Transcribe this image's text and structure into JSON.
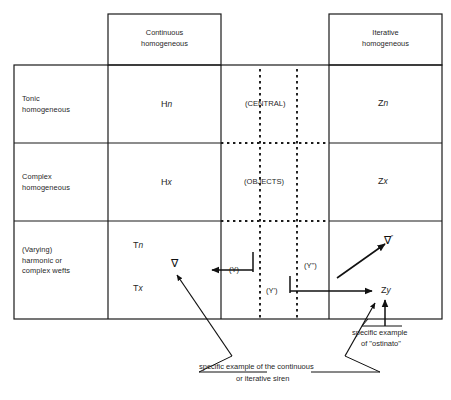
{
  "figure": {
    "kind": "matrix-diagram",
    "column_headers": [
      {
        "id": "continuous",
        "line1": "Continuous",
        "line2": "homogeneous"
      },
      {
        "id": "iterative",
        "line1": "Iterative",
        "line2": "homogeneous"
      }
    ],
    "row_headers": [
      {
        "id": "tonic",
        "line1": "Tonic",
        "line2": "homogeneous",
        "line3": ""
      },
      {
        "id": "complex",
        "line1": "Complex",
        "line2": "homogeneous",
        "line3": ""
      },
      {
        "id": "varying",
        "line1": "(Varying)",
        "line2": "harmonic or",
        "line3": "complex wefts"
      }
    ],
    "cells": {
      "tonic_continuous": "Hn",
      "tonic_central": "(CENTRAL)",
      "tonic_iterative": "Zn",
      "complex_continuous": "Hx",
      "complex_central": "(OBJECTS)",
      "complex_iterative": "Zx",
      "varying_continuous_top": "Tn",
      "varying_continuous_bottom": "Tx",
      "varying_iterative": "Zy"
    },
    "markers": {
      "nabla_plain": "∇",
      "nabla_primed": "∇",
      "nabla_primed_mark": "″"
    },
    "flow_labels": [
      {
        "id": "y",
        "text": "(Y)"
      },
      {
        "id": "y-prime",
        "text": "(Y')"
      },
      {
        "id": "y-double-prime",
        "text": "(Y\")"
      }
    ],
    "annotations": [
      {
        "id": "siren",
        "line1": "specific example of the continuous",
        "line2": "or iterative siren"
      },
      {
        "id": "ostinato",
        "line1": "specific example",
        "line2": "of \"ostinato\""
      }
    ],
    "colors": {
      "stroke": "#1a1a1a",
      "background": "#ffffff",
      "text": "#1f1f1f"
    }
  }
}
